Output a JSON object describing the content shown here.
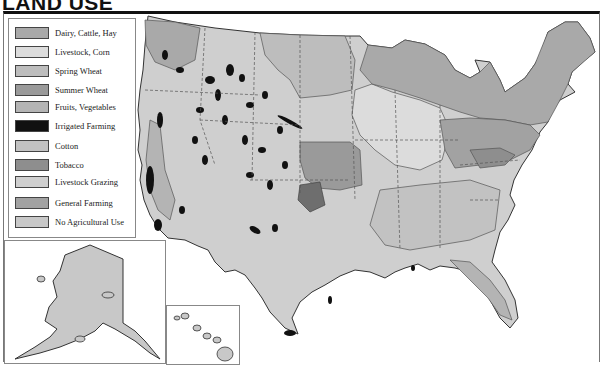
{
  "title": "LAND USE",
  "legend": {
    "items": [
      {
        "label": "Dairy, Cattle, Hay",
        "color": "#a9a9a9"
      },
      {
        "label": "Livestock, Corn",
        "color": "#dcdcdc"
      },
      {
        "label": "Spring Wheat",
        "color": "#bdbdbd"
      },
      {
        "label": "Summer Wheat",
        "color": "#9a9a9a"
      },
      {
        "label": "Fruits, Vegetables",
        "color": "#b4b4b4"
      },
      {
        "label": "Irrigated Farming",
        "color": "#111111"
      },
      {
        "label": "Cotton",
        "color": "#c2c2c2"
      },
      {
        "label": "Tobacco",
        "color": "#8e8e8e"
      },
      {
        "label": "Livestock Grazing",
        "color": "#cfcfcf"
      },
      {
        "label": "General Farming",
        "color": "#a2a2a2"
      },
      {
        "label": "No Agricultural Use",
        "color": "#c8c8c8"
      }
    ]
  },
  "insets": {
    "alaska": {
      "label": "Alaska"
    },
    "hawaii": {
      "label": "Hawaii"
    }
  },
  "colors": {
    "outline": "#333333",
    "state_border": "#555555",
    "background": "#ffffff"
  }
}
